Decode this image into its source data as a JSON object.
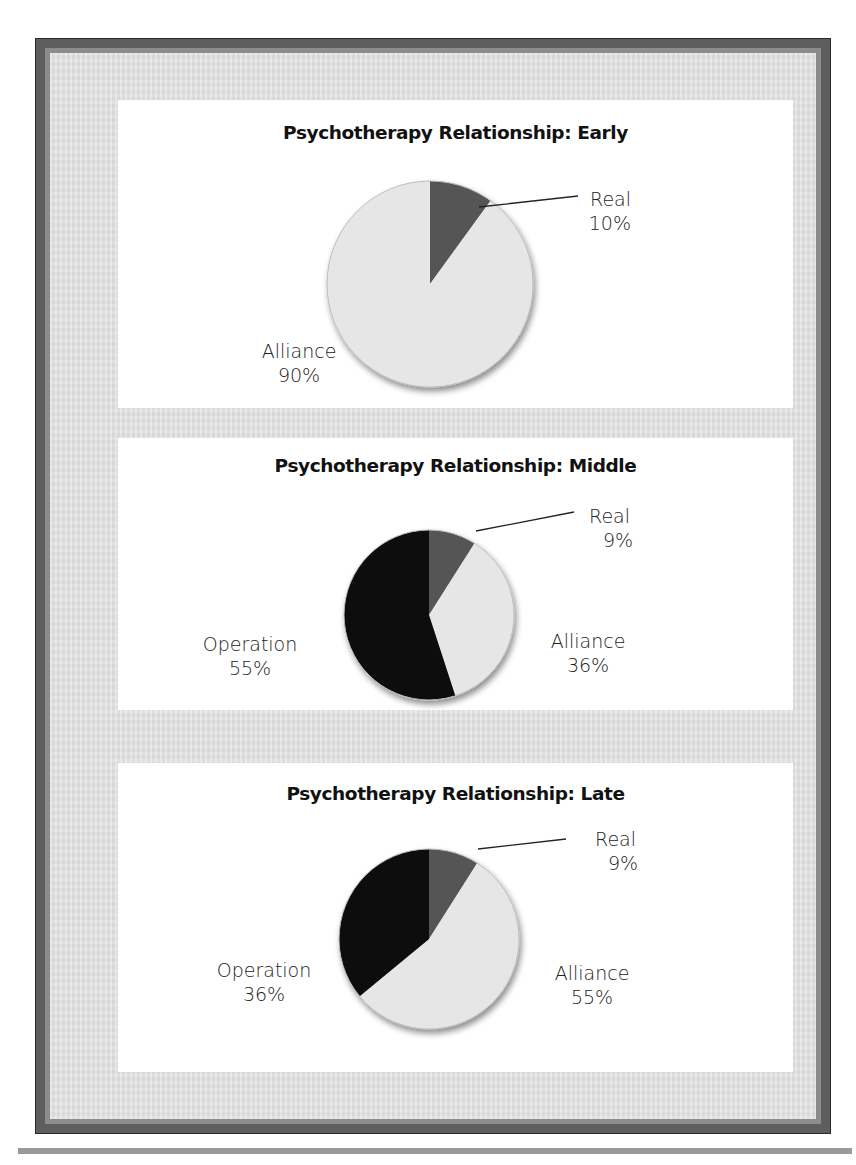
{
  "charts": [
    {
      "title": "Psychotherapy Relationship: Early",
      "labels": {
        "real": {
          "name": "Real",
          "value": "10%"
        },
        "alliance": {
          "name": "Alliance",
          "value": "90%"
        }
      }
    },
    {
      "title": "Psychotherapy Relationship: Middle",
      "labels": {
        "real": {
          "name": "Real",
          "value": "9%"
        },
        "alliance": {
          "name": "Alliance",
          "value": "36%"
        },
        "operation": {
          "name": "Operation",
          "value": "55%"
        }
      }
    },
    {
      "title": "Psychotherapy Relationship: Late",
      "labels": {
        "real": {
          "name": "Real",
          "value": "9%"
        },
        "alliance": {
          "name": "Alliance",
          "value": "55%"
        },
        "operation": {
          "name": "Operation",
          "value": "36%"
        }
      }
    }
  ],
  "colors": {
    "real": "#555555",
    "alliance": "#e6e6e6",
    "operation": "#0d0d0d",
    "frame_outer": "#5e5e5e",
    "frame_band": "#8c8c8c",
    "mat": "#e3e3e3"
  },
  "chart_data": [
    {
      "type": "pie",
      "title": "Psychotherapy Relationship: Early",
      "categories": [
        "Real",
        "Alliance"
      ],
      "values": [
        10,
        90
      ],
      "start_angle": "12 o'clock, clockwise",
      "legend": "none (direct labels)"
    },
    {
      "type": "pie",
      "title": "Psychotherapy Relationship: Middle",
      "categories": [
        "Real",
        "Alliance",
        "Operation"
      ],
      "values": [
        9,
        36,
        55
      ],
      "start_angle": "12 o'clock, clockwise",
      "legend": "none (direct labels)"
    },
    {
      "type": "pie",
      "title": "Psychotherapy Relationship: Late",
      "categories": [
        "Real",
        "Alliance",
        "Operation"
      ],
      "values": [
        9,
        55,
        36
      ],
      "start_angle": "12 o'clock, clockwise",
      "legend": "none (direct labels)"
    }
  ]
}
